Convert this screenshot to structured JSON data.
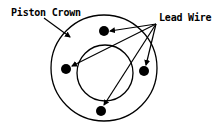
{
  "diagram": {
    "labels": {
      "piston_crown": "Piston Crown",
      "lead_wire": "Lead Wire"
    },
    "colors": {
      "stroke": "#000000",
      "background": "#ffffff"
    },
    "shapes": {
      "outer_circle": {
        "cx": 104,
        "cy": 68,
        "r": 53
      },
      "inner_circle": {
        "cx": 105,
        "cy": 73,
        "r": 28
      },
      "dots": [
        {
          "name": "top",
          "cx": 104,
          "cy": 31
        },
        {
          "name": "left",
          "cx": 66,
          "cy": 69
        },
        {
          "name": "right",
          "cx": 144,
          "cy": 71
        },
        {
          "name": "bottom",
          "cx": 101,
          "cy": 111
        }
      ],
      "lead_wire_apex": {
        "x": 156,
        "y": 24
      }
    }
  }
}
